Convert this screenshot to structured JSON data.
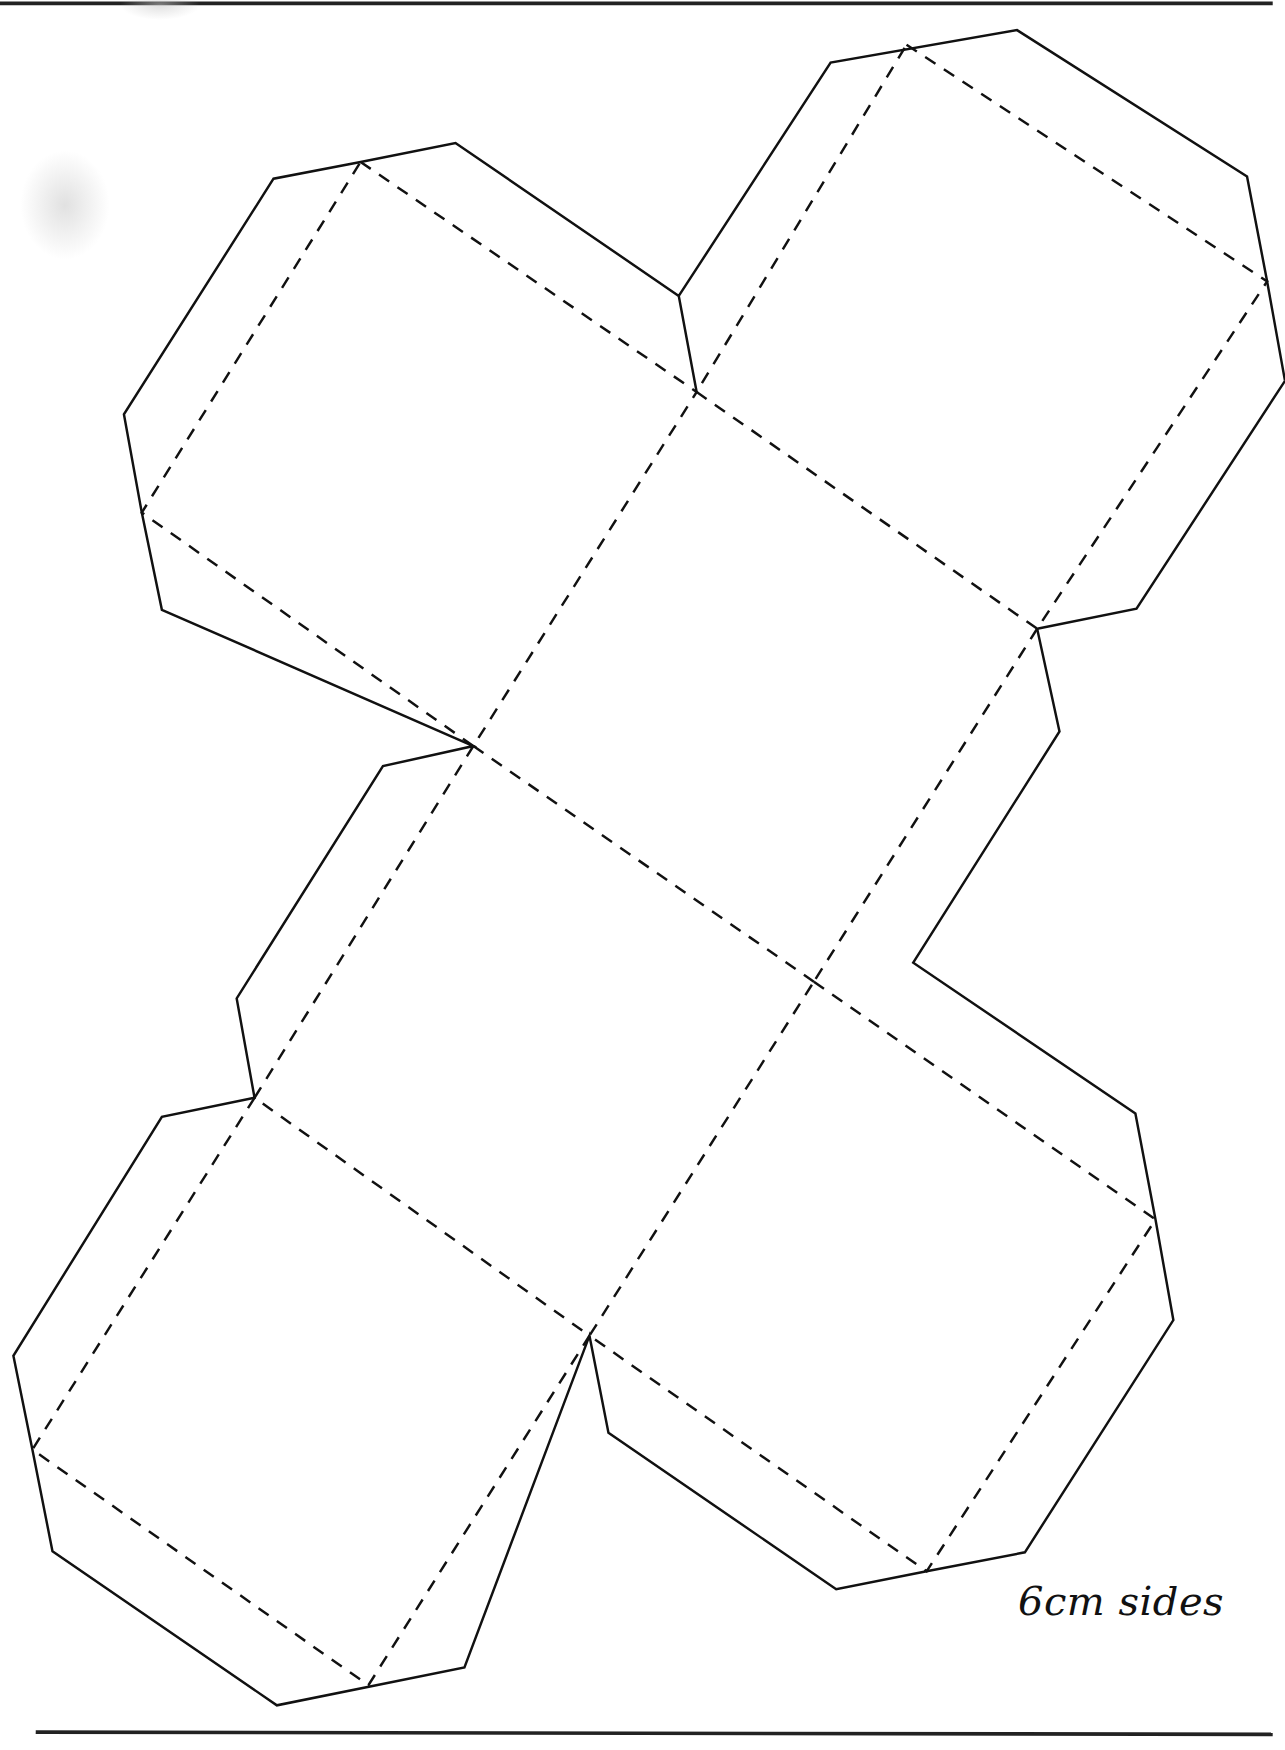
{
  "document": {
    "type": "paper net template",
    "label": "6cm sides",
    "line_styles": {
      "cut_line": "solid",
      "fold_line": "dashed"
    },
    "colors": {
      "background": "#ffffff",
      "ink": "#111111"
    },
    "net": {
      "description": "Cube net of 6 squares with octagonal tab outlines",
      "faces": 6
    }
  }
}
